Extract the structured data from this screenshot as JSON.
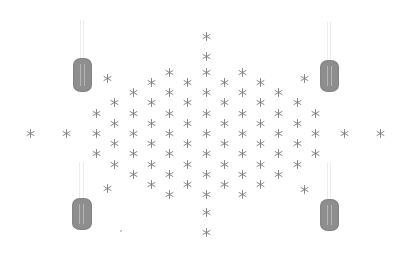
{
  "diagram": {
    "colors": {
      "background": "#ffffff",
      "star": "#7a7a7a",
      "cylinder": "#8e8e8e",
      "wire": "#ececec"
    },
    "cylinders": [
      {
        "id": "top-left",
        "x": 73,
        "y": 58,
        "w": 19,
        "h": 34
      },
      {
        "id": "top-right",
        "x": 320,
        "y": 60,
        "w": 19,
        "h": 32
      },
      {
        "id": "bottom-left",
        "x": 72,
        "y": 198,
        "w": 20,
        "h": 32
      },
      {
        "id": "bottom-right",
        "x": 320,
        "y": 199,
        "w": 19,
        "h": 32
      }
    ],
    "stars": [
      [
        206,
        36
      ],
      [
        206,
        56
      ],
      [
        169,
        72
      ],
      [
        206,
        72
      ],
      [
        242,
        72
      ],
      [
        107,
        78
      ],
      [
        304,
        78
      ],
      [
        151,
        82
      ],
      [
        187,
        82
      ],
      [
        224,
        82
      ],
      [
        260,
        82
      ],
      [
        133,
        92
      ],
      [
        169,
        92
      ],
      [
        206,
        92
      ],
      [
        242,
        92
      ],
      [
        278,
        92
      ],
      [
        114,
        102
      ],
      [
        151,
        102
      ],
      [
        187,
        102
      ],
      [
        224,
        102
      ],
      [
        260,
        102
      ],
      [
        297,
        102
      ],
      [
        96,
        113
      ],
      [
        133,
        113
      ],
      [
        169,
        113
      ],
      [
        206,
        113
      ],
      [
        242,
        113
      ],
      [
        278,
        113
      ],
      [
        315,
        113
      ],
      [
        114,
        123
      ],
      [
        151,
        123
      ],
      [
        187,
        123
      ],
      [
        224,
        123
      ],
      [
        260,
        123
      ],
      [
        297,
        123
      ],
      [
        30,
        133
      ],
      [
        66,
        133
      ],
      [
        96,
        133
      ],
      [
        133,
        133
      ],
      [
        169,
        133
      ],
      [
        206,
        133
      ],
      [
        242,
        133
      ],
      [
        278,
        133
      ],
      [
        315,
        133
      ],
      [
        344,
        133
      ],
      [
        380,
        133
      ],
      [
        114,
        143
      ],
      [
        151,
        143
      ],
      [
        187,
        143
      ],
      [
        224,
        143
      ],
      [
        260,
        143
      ],
      [
        297,
        143
      ],
      [
        96,
        153
      ],
      [
        133,
        153
      ],
      [
        169,
        153
      ],
      [
        206,
        153
      ],
      [
        242,
        153
      ],
      [
        278,
        153
      ],
      [
        315,
        153
      ],
      [
        114,
        164
      ],
      [
        151,
        164
      ],
      [
        187,
        164
      ],
      [
        224,
        164
      ],
      [
        260,
        164
      ],
      [
        297,
        164
      ],
      [
        133,
        174
      ],
      [
        169,
        174
      ],
      [
        206,
        174
      ],
      [
        242,
        174
      ],
      [
        278,
        174
      ],
      [
        107,
        188
      ],
      [
        151,
        184
      ],
      [
        187,
        184
      ],
      [
        224,
        184
      ],
      [
        260,
        184
      ],
      [
        304,
        189
      ],
      [
        169,
        194
      ],
      [
        206,
        194
      ],
      [
        242,
        194
      ],
      [
        206,
        212
      ],
      [
        206,
        232
      ]
    ],
    "dots": [
      [
        120,
        230
      ]
    ]
  }
}
